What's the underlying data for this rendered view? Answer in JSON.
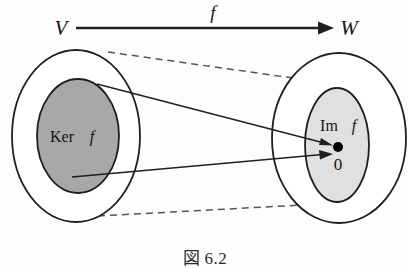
{
  "figure": {
    "caption_symbol": "図",
    "caption_number": "6.2",
    "domain_label": "V",
    "codomain_label": "W",
    "map_label": "f",
    "kernel_label_roman": "Ker",
    "kernel_label_italic": "f",
    "image_label_roman": "Im",
    "image_label_italic": "f",
    "zero_label": "0",
    "colors": {
      "stroke": "#1f1f1f",
      "kernel_fill": "#a8a8a8",
      "image_fill": "#e0e0e0",
      "dashed_stroke": "#555555",
      "point_fill": "#000000",
      "background": "#fdfdfd"
    },
    "elements": {
      "domain_outer_ellipse": "V",
      "domain_inner_ellipse": "Ker f",
      "codomain_outer_ellipse": "W",
      "codomain_inner_ellipse": "Im f",
      "zero_point": "0",
      "map_arrow": "f",
      "mapping_arrow_upper": "Ker f top to 0",
      "mapping_arrow_lower": "Ker f bottom to 0",
      "dashed_guide_upper": "V upper boundary to W upper boundary",
      "dashed_guide_lower": "V lower boundary to W lower boundary"
    }
  }
}
